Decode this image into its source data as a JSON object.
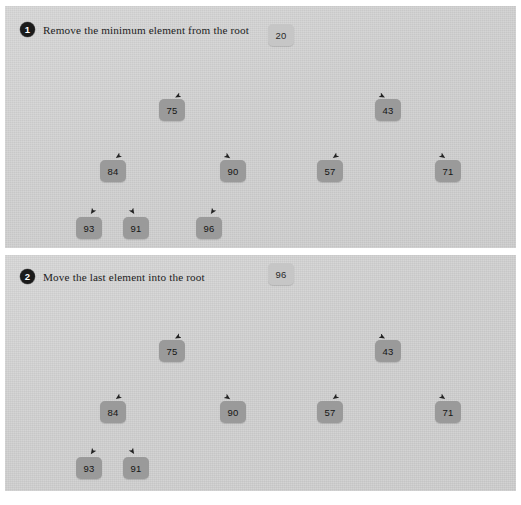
{
  "figure": {
    "type": "diagram",
    "subtype": "binary-heap-operation-steps",
    "panel_count": 2
  },
  "colors": {
    "panel_background": "#d2d2d2",
    "node_fill": "#9a9a9a",
    "root_node_fill": "#c6c6c6",
    "node_text": "#151515",
    "badge_fill": "#1b1b1b",
    "badge_text": "#ffffff",
    "arrow": "#222222",
    "page_background": "#ffffff"
  },
  "panels": [
    {
      "badge": "1",
      "caption": "Remove the minimum element from the root",
      "tree": {
        "levels": [
          [
            "20"
          ],
          [
            "75",
            "43"
          ],
          [
            "84",
            "90",
            "57",
            "71"
          ],
          [
            "93",
            "91",
            "96"
          ]
        ],
        "nodes": [
          {
            "label": "20",
            "x": 281,
            "y": 35,
            "role": "root",
            "highlight": true
          },
          {
            "label": "75",
            "x": 172,
            "y": 110,
            "role": "internal",
            "highlight": false
          },
          {
            "label": "43",
            "x": 388,
            "y": 110,
            "role": "internal",
            "highlight": false
          },
          {
            "label": "84",
            "x": 113,
            "y": 171,
            "role": "internal",
            "highlight": false
          },
          {
            "label": "90",
            "x": 233,
            "y": 171,
            "role": "internal",
            "highlight": false
          },
          {
            "label": "57",
            "x": 330,
            "y": 171,
            "role": "leaf",
            "highlight": false
          },
          {
            "label": "71",
            "x": 448,
            "y": 171,
            "role": "leaf",
            "highlight": false
          },
          {
            "label": "93",
            "x": 89,
            "y": 228,
            "role": "leaf",
            "highlight": false
          },
          {
            "label": "91",
            "x": 136,
            "y": 228,
            "role": "leaf",
            "highlight": false
          },
          {
            "label": "96",
            "x": 209,
            "y": 228,
            "role": "leaf",
            "highlight": false
          }
        ],
        "edges": [
          {
            "from": "20",
            "to": "75"
          },
          {
            "from": "20",
            "to": "43"
          },
          {
            "from": "75",
            "to": "84"
          },
          {
            "from": "75",
            "to": "90"
          },
          {
            "from": "43",
            "to": "57"
          },
          {
            "from": "43",
            "to": "71"
          },
          {
            "from": "84",
            "to": "93"
          },
          {
            "from": "84",
            "to": "91"
          },
          {
            "from": "90",
            "to": "96"
          }
        ]
      }
    },
    {
      "badge": "2",
      "caption": "Move the last element into the root",
      "tree": {
        "levels": [
          [
            "96"
          ],
          [
            "75",
            "43"
          ],
          [
            "84",
            "90",
            "57",
            "71"
          ],
          [
            "93",
            "91"
          ]
        ],
        "nodes": [
          {
            "label": "96",
            "x": 281,
            "y": 274,
            "role": "root",
            "highlight": true
          },
          {
            "label": "75",
            "x": 172,
            "y": 351,
            "role": "internal",
            "highlight": false
          },
          {
            "label": "43",
            "x": 388,
            "y": 351,
            "role": "internal",
            "highlight": false
          },
          {
            "label": "84",
            "x": 113,
            "y": 412,
            "role": "internal",
            "highlight": false
          },
          {
            "label": "90",
            "x": 233,
            "y": 412,
            "role": "leaf",
            "highlight": false
          },
          {
            "label": "57",
            "x": 330,
            "y": 412,
            "role": "leaf",
            "highlight": false
          },
          {
            "label": "71",
            "x": 448,
            "y": 412,
            "role": "leaf",
            "highlight": false
          },
          {
            "label": "93",
            "x": 89,
            "y": 468,
            "role": "leaf",
            "highlight": false
          },
          {
            "label": "91",
            "x": 136,
            "y": 468,
            "role": "leaf",
            "highlight": false
          }
        ],
        "edges": [
          {
            "from": "96",
            "to": "75"
          },
          {
            "from": "96",
            "to": "43"
          },
          {
            "from": "75",
            "to": "84"
          },
          {
            "from": "75",
            "to": "90"
          },
          {
            "from": "43",
            "to": "57"
          },
          {
            "from": "43",
            "to": "71"
          },
          {
            "from": "84",
            "to": "93"
          },
          {
            "from": "84",
            "to": "91"
          }
        ]
      }
    }
  ]
}
